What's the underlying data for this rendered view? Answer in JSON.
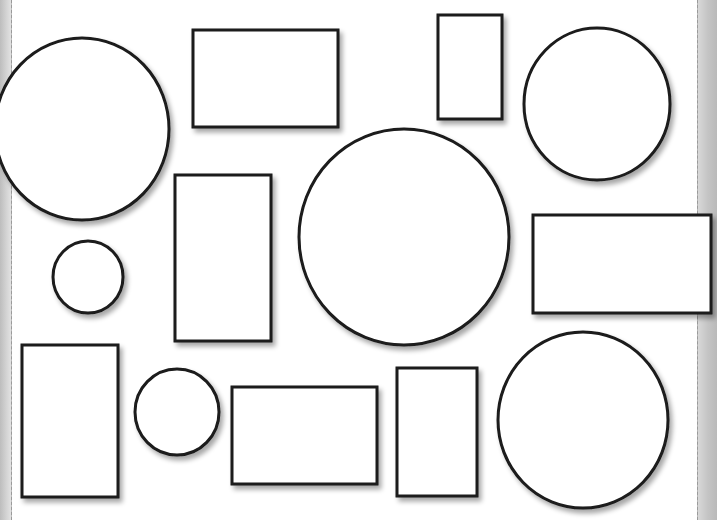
{
  "worksheet": {
    "description": "Shape worksheet with outlined circles and rectangles",
    "paper_color": "#ffffff",
    "outline_color": "#1a1a1a",
    "margin_color": "#c8c8c8",
    "header_fragment": "",
    "shapes": [
      {
        "type": "circle",
        "name": "circle-large-top-left",
        "cx": 82,
        "cy": 129,
        "rx": 87,
        "ry": 91
      },
      {
        "type": "rect",
        "name": "rect-wide-top-middle",
        "x": 193,
        "y": 30,
        "w": 145,
        "h": 97
      },
      {
        "type": "rect",
        "name": "rect-tall-top",
        "x": 438,
        "y": 15,
        "w": 64,
        "h": 104
      },
      {
        "type": "circle",
        "name": "circle-top-right",
        "cx": 597,
        "cy": 104,
        "rx": 73,
        "ry": 76
      },
      {
        "type": "rect",
        "name": "rect-tall-center-left",
        "x": 175,
        "y": 175,
        "w": 96,
        "h": 166
      },
      {
        "type": "circle",
        "name": "circle-large-center",
        "cx": 404,
        "cy": 237,
        "rx": 105,
        "ry": 108
      },
      {
        "type": "rect",
        "name": "rect-wide-right",
        "x": 533,
        "y": 215,
        "w": 178,
        "h": 98
      },
      {
        "type": "circle",
        "name": "circle-small-left",
        "cx": 88,
        "cy": 277,
        "rx": 35,
        "ry": 36
      },
      {
        "type": "rect",
        "name": "rect-tall-bottom-left",
        "x": 22,
        "y": 345,
        "w": 96,
        "h": 152
      },
      {
        "type": "circle",
        "name": "circle-small-bottom",
        "cx": 177,
        "cy": 412,
        "rx": 42,
        "ry": 43
      },
      {
        "type": "rect",
        "name": "rect-wide-bottom-middle",
        "x": 232,
        "y": 387,
        "w": 145,
        "h": 97
      },
      {
        "type": "rect",
        "name": "rect-tall-bottom-middle",
        "x": 397,
        "y": 368,
        "w": 80,
        "h": 128
      },
      {
        "type": "circle",
        "name": "circle-bottom-right",
        "cx": 583,
        "cy": 420,
        "rx": 85,
        "ry": 88
      }
    ]
  }
}
